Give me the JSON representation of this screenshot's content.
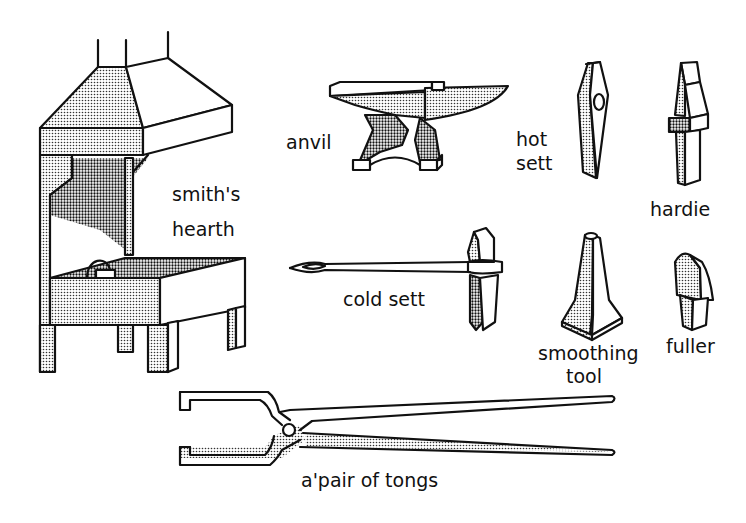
{
  "diagram": {
    "colors": {
      "ink": "#111111",
      "background": "#ffffff"
    },
    "labels": {
      "hearth": [
        "smith's",
        "hearth"
      ],
      "anvil": "anvil",
      "hot_sett": [
        "hot",
        "sett"
      ],
      "hardie": "hardie",
      "cold_sett": "cold sett",
      "smoothing_tool": [
        "smoothing",
        "tool"
      ],
      "fuller": "fuller",
      "tongs": "a'pair of tongs"
    }
  }
}
